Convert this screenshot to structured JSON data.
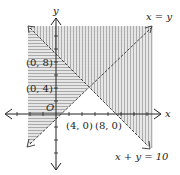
{
  "diagram": {
    "type": "linear-inequality-graph",
    "axes": {
      "x_label": "x",
      "y_label": "y",
      "origin_label": "O"
    },
    "lines": [
      {
        "id": "line-x-eq-y",
        "label": "x = y"
      },
      {
        "id": "line-x-plus-y-eq-10",
        "label": "x + y = 10"
      }
    ],
    "points": [
      {
        "id": "p-0-8",
        "label": "(0, 8)"
      },
      {
        "id": "p-0-4",
        "label": "(0, 4)"
      },
      {
        "id": "p-4-0",
        "label": "(4, 0)"
      },
      {
        "id": "p-8-0",
        "label": "(8, 0)"
      }
    ],
    "regions": [
      {
        "id": "region-y-ge-x",
        "pattern": "horizontal-hatch"
      },
      {
        "id": "region-x-plus-y-ge-10",
        "pattern": "vertical-hatch"
      }
    ],
    "colors": {
      "hatch": "#9a9a9a",
      "fill": "#e4e4e4",
      "line": "#333333",
      "axis": "#222222"
    }
  }
}
